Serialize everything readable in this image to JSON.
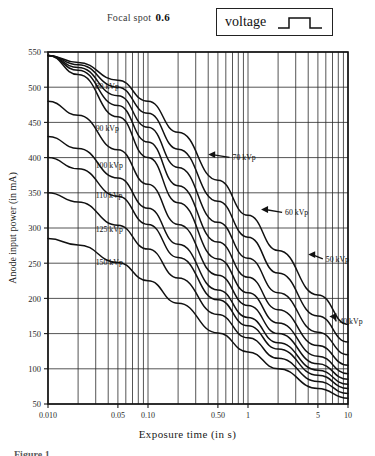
{
  "header": {
    "focal_spot_label": "Focal spot",
    "focal_spot_value": "0.6",
    "voltage_label": "voltage",
    "waveform_icon": "square-pulse-waveform"
  },
  "figure": {
    "caption": "Figure 1"
  },
  "chart_data": {
    "type": "line",
    "title": "",
    "xlabel": "Exposure time (in s)",
    "ylabel": "Anode input power (in mA)",
    "xscale": "log",
    "yscale": "linear",
    "xlim": [
      0.01,
      10
    ],
    "ylim": [
      50,
      550
    ],
    "grid": true,
    "legend_position": "inline-labels",
    "xticks": [
      {
        "value": 0.01,
        "label": "0.010"
      },
      {
        "value": 0.05,
        "label": "0.05"
      },
      {
        "value": 0.1,
        "label": "0.10"
      },
      {
        "value": 0.5,
        "label": "0.50"
      },
      {
        "value": 1,
        "label": "1"
      },
      {
        "value": 5,
        "label": "5"
      },
      {
        "value": 10,
        "label": "10"
      }
    ],
    "yticks": [
      50,
      100,
      150,
      200,
      250,
      300,
      350,
      400,
      450,
      500,
      550
    ],
    "x_minor_gridlines": [
      0.01,
      0.02,
      0.03,
      0.04,
      0.05,
      0.06,
      0.07,
      0.08,
      0.09,
      0.1,
      0.2,
      0.3,
      0.4,
      0.5,
      0.6,
      0.7,
      0.8,
      0.9,
      1,
      2,
      3,
      4,
      5,
      6,
      7,
      8,
      9,
      10
    ],
    "series": [
      {
        "name": "40 kVp",
        "label": "40 kVp",
        "label_mode": "arrow",
        "label_x": 8.2,
        "label_y": 163,
        "arrow_from_x": 6.5,
        "arrow_from_y": 170,
        "x": [
          0.01,
          0.02,
          0.05,
          0.1,
          0.2,
          0.5,
          1,
          2,
          5,
          10
        ],
        "y": [
          545,
          535,
          510,
          480,
          436,
          368,
          318,
          268,
          205,
          163
        ]
      },
      {
        "name": "50 kVp",
        "label": "50 kVp",
        "label_mode": "arrow",
        "label_x": 6.0,
        "label_y": 252,
        "arrow_from_x": 4.0,
        "arrow_from_y": 258,
        "x": [
          0.01,
          0.02,
          0.05,
          0.1,
          0.2,
          0.5,
          1,
          2,
          5,
          10
        ],
        "y": [
          545,
          532,
          500,
          463,
          412,
          338,
          287,
          236,
          175,
          138
        ]
      },
      {
        "name": "60 kVp",
        "label": "60 kVp",
        "label_mode": "arrow",
        "label_x": 2.35,
        "label_y": 318,
        "arrow_from_x": 1.35,
        "arrow_from_y": 322,
        "x": [
          0.01,
          0.02,
          0.05,
          0.1,
          0.2,
          0.5,
          1,
          2,
          5,
          10
        ],
        "y": [
          545,
          528,
          488,
          443,
          386,
          308,
          257,
          208,
          152,
          120
        ]
      },
      {
        "name": "70 kVp",
        "label": "70 kVp",
        "label_mode": "arrow",
        "label_x": 0.7,
        "label_y": 396,
        "arrow_from_x": 0.4,
        "arrow_from_y": 400,
        "x": [
          0.01,
          0.02,
          0.05,
          0.1,
          0.2,
          0.5,
          1,
          2,
          5,
          10
        ],
        "y": [
          545,
          524,
          474,
          422,
          360,
          280,
          230,
          184,
          133,
          105
        ]
      },
      {
        "name": "80 kVp",
        "label": "80 kVp",
        "label_mode": "inline",
        "label_x": 0.03,
        "label_y": 497,
        "x": [
          0.01,
          0.02,
          0.05,
          0.1,
          0.2,
          0.5,
          1,
          2,
          5,
          10
        ],
        "y": [
          545,
          518,
          458,
          400,
          336,
          256,
          208,
          165,
          118,
          93
        ]
      },
      {
        "name": "90 kVp",
        "label": "90 kVp",
        "label_mode": "inline",
        "label_x": 0.03,
        "label_y": 438,
        "x": [
          0.01,
          0.02,
          0.05,
          0.1,
          0.2,
          0.5,
          1,
          2,
          5,
          10
        ],
        "y": [
          480,
          460,
          411,
          362,
          305,
          233,
          190,
          150,
          107,
          85
        ]
      },
      {
        "name": "100 kVp",
        "label": "100 kVp",
        "label_mode": "inline",
        "label_x": 0.03,
        "label_y": 385,
        "x": [
          0.01,
          0.02,
          0.05,
          0.1,
          0.2,
          0.5,
          1,
          2,
          5,
          10
        ],
        "y": [
          430,
          413,
          371,
          328,
          277,
          212,
          173,
          137,
          98,
          78
        ]
      },
      {
        "name": "110 kVp",
        "label": "110 kVp",
        "label_mode": "inline",
        "label_x": 0.03,
        "label_y": 343,
        "x": [
          0.01,
          0.02,
          0.05,
          0.1,
          0.2,
          0.5,
          1,
          2,
          5,
          10
        ],
        "y": [
          400,
          384,
          345,
          305,
          258,
          198,
          161,
          128,
          91,
          72
        ]
      },
      {
        "name": "125 kVp",
        "label": "125 kVp",
        "label_mode": "inline",
        "label_x": 0.03,
        "label_y": 295,
        "x": [
          0.01,
          0.02,
          0.05,
          0.1,
          0.2,
          0.5,
          1,
          2,
          5,
          10
        ],
        "y": [
          350,
          337,
          304,
          270,
          229,
          177,
          144,
          115,
          82,
          65
        ]
      },
      {
        "name": "150 kVp",
        "label": "150 kVp",
        "label_mode": "inline",
        "label_x": 0.03,
        "label_y": 248,
        "x": [
          0.01,
          0.02,
          0.05,
          0.1,
          0.2,
          0.5,
          1,
          2,
          5,
          10
        ],
        "y": [
          285,
          276,
          251,
          225,
          193,
          151,
          124,
          100,
          72,
          58
        ]
      }
    ]
  }
}
